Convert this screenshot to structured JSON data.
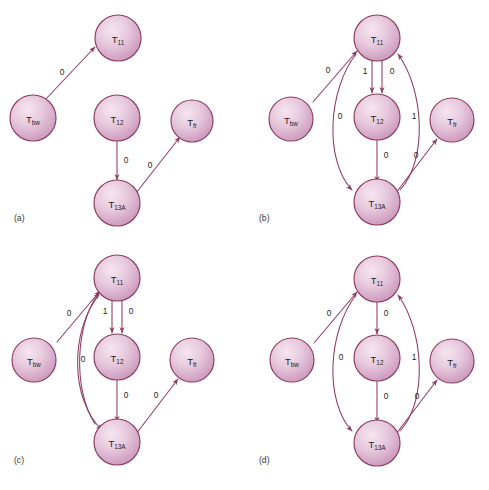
{
  "figure": {
    "background_color": "#ffffff",
    "node_border_color": "#8e3b63",
    "node_fill_light": "#f0dce8",
    "node_fill_mid": "#dcb4d0",
    "node_fill_dark": "#c490b4",
    "edge_color": "#8e3b63",
    "label_color": "#231f20"
  },
  "node_labels": {
    "t11": {
      "base": "T",
      "sub": "11"
    },
    "t12": {
      "base": "T",
      "sub": "12"
    },
    "t13a": {
      "base": "T",
      "sub": "13A"
    },
    "tbw": {
      "base": "T",
      "sub": "bw"
    },
    "tf": {
      "base": "T",
      "sub": "fr"
    }
  },
  "panels": [
    {
      "id": "a",
      "caption": "(a)",
      "nodes": [
        {
          "key": "tbw",
          "label_base": "T",
          "label_sub": "bw"
        },
        {
          "key": "t11",
          "label_base": "T",
          "label_sub": "11"
        },
        {
          "key": "t12",
          "label_base": "T",
          "label_sub": "12"
        },
        {
          "key": "t13a",
          "label_base": "T",
          "label_sub": "13A"
        },
        {
          "key": "tf",
          "label_base": "T",
          "label_sub": "fr"
        }
      ],
      "edges": [
        {
          "from": "tbw",
          "to": "t11",
          "label": "0"
        },
        {
          "from": "t12",
          "to": "t13a",
          "label": "0"
        },
        {
          "from": "t13a",
          "to": "tf",
          "label": "0"
        }
      ]
    },
    {
      "id": "b",
      "caption": "(b)",
      "nodes": [
        {
          "key": "tbw",
          "label_base": "T",
          "label_sub": "bw"
        },
        {
          "key": "t11",
          "label_base": "T",
          "label_sub": "11"
        },
        {
          "key": "t12",
          "label_base": "T",
          "label_sub": "12"
        },
        {
          "key": "t13a",
          "label_base": "T",
          "label_sub": "13A"
        },
        {
          "key": "tf",
          "label_base": "T",
          "label_sub": "fr"
        }
      ],
      "edges": [
        {
          "from": "tbw",
          "to": "t11",
          "label": "0"
        },
        {
          "from": "t11",
          "to": "t12",
          "label": "1"
        },
        {
          "from": "t11",
          "to": "t12",
          "label": "0"
        },
        {
          "from": "t11",
          "to": "t13a",
          "label": "0"
        },
        {
          "from": "t13a",
          "to": "t11",
          "label": "1"
        },
        {
          "from": "t12",
          "to": "t13a",
          "label": "0"
        },
        {
          "from": "t13a",
          "to": "tf",
          "label": "0"
        }
      ]
    },
    {
      "id": "c",
      "caption": "(c)",
      "nodes": [
        {
          "key": "tbw",
          "label_base": "T",
          "label_sub": "bw"
        },
        {
          "key": "t11",
          "label_base": "T",
          "label_sub": "11"
        },
        {
          "key": "t12",
          "label_base": "T",
          "label_sub": "12"
        },
        {
          "key": "t13a",
          "label_base": "T",
          "label_sub": "13A"
        },
        {
          "key": "tf",
          "label_base": "T",
          "label_sub": "fr"
        }
      ],
      "edges": [
        {
          "from": "tbw",
          "to": "t11",
          "label": "0"
        },
        {
          "from": "t11",
          "to": "t12",
          "label": "1"
        },
        {
          "from": "t11",
          "to": "t12",
          "label": "0"
        },
        {
          "from": "t11",
          "to": "t13a",
          "label": "0"
        },
        {
          "from": "t13a",
          "to": "t11",
          "label": ""
        },
        {
          "from": "t12",
          "to": "t13a",
          "label": "0"
        },
        {
          "from": "t13a",
          "to": "tf",
          "label": "0"
        }
      ]
    },
    {
      "id": "d",
      "caption": "(d)",
      "nodes": [
        {
          "key": "tbw",
          "label_base": "T",
          "label_sub": "bw"
        },
        {
          "key": "t11",
          "label_base": "T",
          "label_sub": "11"
        },
        {
          "key": "t12",
          "label_base": "T",
          "label_sub": "12"
        },
        {
          "key": "t13a",
          "label_base": "T",
          "label_sub": "13A"
        },
        {
          "key": "tf",
          "label_base": "T",
          "label_sub": "fr"
        }
      ],
      "edges": [
        {
          "from": "tbw",
          "to": "t11",
          "label": "0"
        },
        {
          "from": "t11",
          "to": "t12",
          "label": "0"
        },
        {
          "from": "t11",
          "to": "t13a",
          "label": "0"
        },
        {
          "from": "t13a",
          "to": "t11",
          "label": "1"
        },
        {
          "from": "t12",
          "to": "t13a",
          "label": "0"
        },
        {
          "from": "t13a",
          "to": "tf",
          "label": "0"
        }
      ]
    }
  ],
  "edge_labels": {
    "a": {
      "bw_11": "0",
      "12_13a": "0",
      "13a_f": "0"
    },
    "b": {
      "bw_11": "0",
      "11_12_left": "1",
      "11_12_right": "0",
      "11_13a": "0",
      "13a_11": "1",
      "12_13a": "0",
      "13a_f": "0"
    },
    "c": {
      "bw_11": "0",
      "11_12_left": "1",
      "11_12_right": "0",
      "11_13a": "0",
      "12_13a": "0",
      "13a_f": "0"
    },
    "d": {
      "bw_11": "0",
      "11_12": "0",
      "11_13a": "0",
      "13a_11": "1",
      "12_13a": "0",
      "13a_f": "0"
    }
  },
  "captions": {
    "a": "(a)",
    "b": "(b)",
    "c": "(c)",
    "d": "(d)"
  }
}
